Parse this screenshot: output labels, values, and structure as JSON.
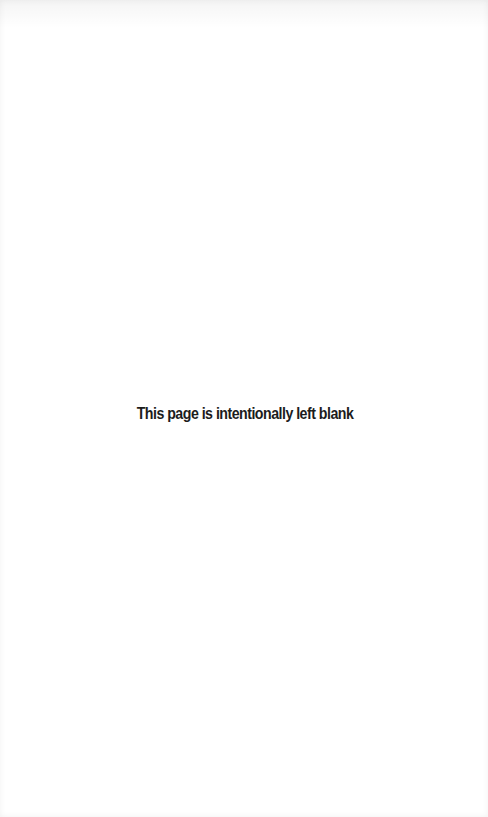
{
  "page": {
    "notice": "This page is intentionally left blank"
  }
}
